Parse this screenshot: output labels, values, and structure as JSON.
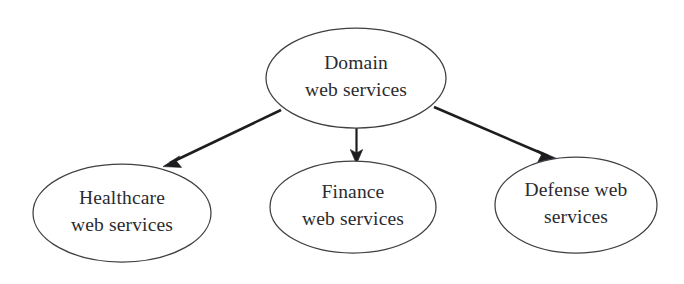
{
  "diagram": {
    "type": "hierarchy-tree",
    "background_color": "#ffffff",
    "node_stroke_color": "#3f3f44",
    "edge_color": "#1d1d20",
    "text_color": "#2b2b2f",
    "root": {
      "id": "domain-web-services",
      "line1": "Domain",
      "line2": "web services",
      "full_text": "Domain web services"
    },
    "children": [
      {
        "id": "healthcare-web-services",
        "line1": "Healthcare",
        "line2": "web services",
        "full_text": "Healthcare web services"
      },
      {
        "id": "finance-web-services",
        "line1": "Finance",
        "line2": "web services",
        "full_text": "Finance web services"
      },
      {
        "id": "defense-web-services",
        "line1": "Defense web",
        "line2": "services",
        "full_text": "Defense web services"
      }
    ],
    "edges": [
      {
        "id": "edge-domain-healthcare",
        "from": "domain-web-services",
        "to": "healthcare-web-services",
        "style": "solid-arrow"
      },
      {
        "id": "edge-domain-finance",
        "from": "domain-web-services",
        "to": "finance-web-services",
        "style": "solid-arrow"
      },
      {
        "id": "edge-domain-defense",
        "from": "domain-web-services",
        "to": "defense-web-services",
        "style": "solid-arrow"
      }
    ]
  }
}
